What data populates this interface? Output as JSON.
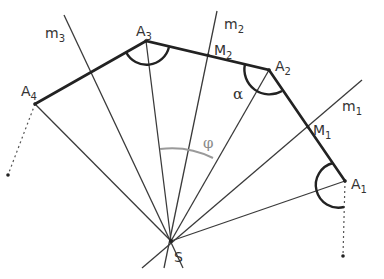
{
  "diagram": {
    "points": {
      "S": {
        "label": "S",
        "x": 171,
        "y": 241
      },
      "A1": {
        "label": "A",
        "sub": "1",
        "x": 345,
        "y": 181
      },
      "A2": {
        "label": "A",
        "sub": "2",
        "x": 269,
        "y": 70
      },
      "A3": {
        "label": "A",
        "sub": "3",
        "x": 146,
        "y": 41
      },
      "A4": {
        "label": "A",
        "sub": "4",
        "x": 35,
        "y": 104
      },
      "M1": {
        "label": "M",
        "sub": "1",
        "x": 308,
        "y": 127
      },
      "M2": {
        "label": "M",
        "sub": "2",
        "x": 208,
        "y": 55
      }
    },
    "lines": {
      "m1": {
        "label": "m",
        "sub": "1"
      },
      "m2": {
        "label": "m",
        "sub": "2"
      },
      "m3": {
        "label": "m",
        "sub": "3"
      }
    },
    "angles": {
      "alpha": "α",
      "phi": "φ"
    },
    "colors": {
      "line": "#333333",
      "polygon": "#222222",
      "arc_phi": "#999999"
    }
  }
}
